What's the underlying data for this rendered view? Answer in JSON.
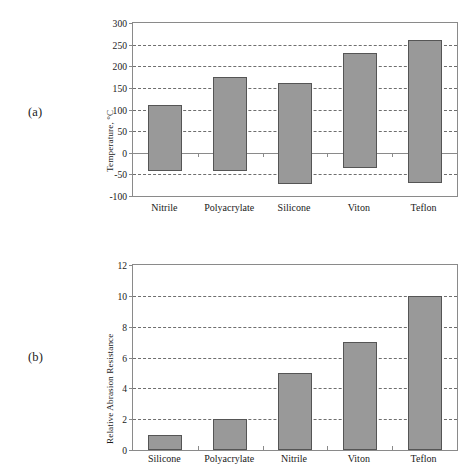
{
  "figure": {
    "panels": [
      {
        "label": "(a)",
        "ylabel": "Temperature, °C",
        "xlabels": [
          "Nitrile",
          "Polyacrylate",
          "Silicone",
          "Viton",
          "Teflon"
        ],
        "yticks": [
          "300",
          "250",
          "200",
          "150",
          "100",
          "50",
          "0",
          "-50",
          "-100"
        ]
      },
      {
        "label": "(b)",
        "ylabel": "Relative Abrasion Resistance",
        "xlabels": [
          "Silicone",
          "Polyacrylate",
          "Nitrile",
          "Viton",
          "Teflon"
        ],
        "yticks": [
          "12",
          "10",
          "8",
          "6",
          "4",
          "2",
          "0"
        ]
      }
    ]
  },
  "colors": {
    "bar_fill": "#999999",
    "bar_stroke": "#555555",
    "axis": "#8a8a8a",
    "grid": "#6e6e6e",
    "background": "#ffffff",
    "text": "#1a1a1a"
  },
  "chart_data": [
    {
      "type": "bar",
      "panel": "(a)",
      "title": "",
      "xlabel": "",
      "ylabel": "Temperature, °C",
      "categories": [
        "Nitrile",
        "Polyacrylate",
        "Silicone",
        "Viton",
        "Teflon"
      ],
      "range_bars": true,
      "series": [
        {
          "name": "Max service temperature",
          "values": [
            110,
            174,
            161,
            230,
            260
          ]
        },
        {
          "name": "Min service temperature",
          "values": [
            -42,
            -42,
            -73,
            -35,
            -70
          ]
        }
      ],
      "ylim": [
        -100,
        300
      ],
      "ytick_values": [
        -100,
        -50,
        0,
        50,
        100,
        150,
        200,
        250,
        300
      ],
      "grid": "horizontal-dashed",
      "legend": "none",
      "zero_line": true
    },
    {
      "type": "bar",
      "panel": "(b)",
      "title": "",
      "xlabel": "",
      "ylabel": "Relative Abrasion Resistance",
      "categories": [
        "Silicone",
        "Polyacrylate",
        "Nitrile",
        "Viton",
        "Teflon"
      ],
      "values": [
        1,
        2,
        5,
        7,
        10
      ],
      "ylim": [
        0,
        12
      ],
      "ytick_values": [
        0,
        2,
        4,
        6,
        8,
        10,
        12
      ],
      "grid": "horizontal-dashed",
      "legend": "none",
      "zero_line": false
    }
  ]
}
